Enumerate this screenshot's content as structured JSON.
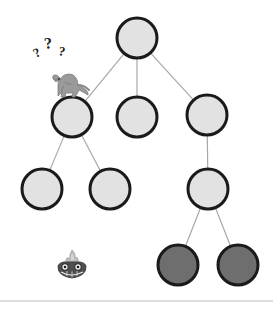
{
  "scene": {
    "title": "search-tree-diagram",
    "width": 273,
    "height": 316,
    "background_color": "#ffffff"
  },
  "palette": {
    "node_light_fill": "#e2e2e2",
    "node_dark_fill": "#6e6e6e",
    "node_stroke": "#1a1a1a",
    "edge_color": "#a8a8a8",
    "baseline_color": "#d0d0d0",
    "thinking_mark_color": "#1a1a1a",
    "dino_body": "#9a9a9a",
    "dino_shade": "#7b7b7b",
    "creature_body": "#4a4a4a",
    "creature_flame": "#b9b9b9"
  },
  "tree": {
    "node_radius": 20,
    "node_stroke_width": 3,
    "edge_stroke_width": 1.2,
    "nodes": [
      {
        "id": "root",
        "label": "node-root",
        "cx": 137,
        "cy": 38,
        "r": 20,
        "state": "light"
      },
      {
        "id": "n-l",
        "label": "node-left-branch",
        "cx": 72,
        "cy": 117,
        "r": 20,
        "state": "light"
      },
      {
        "id": "n-m",
        "label": "node-middle-branch",
        "cx": 137,
        "cy": 117,
        "r": 20,
        "state": "light"
      },
      {
        "id": "n-r",
        "label": "node-right-branch",
        "cx": 207,
        "cy": 115,
        "r": 20,
        "state": "light"
      },
      {
        "id": "n-ll",
        "label": "node-leaf-left",
        "cx": 42,
        "cy": 189,
        "r": 20,
        "state": "light"
      },
      {
        "id": "n-lr",
        "label": "node-leaf-mid-left",
        "cx": 110,
        "cy": 189,
        "r": 20,
        "state": "light"
      },
      {
        "id": "n-rc",
        "label": "node-right-child",
        "cx": 208,
        "cy": 189,
        "r": 20,
        "state": "light"
      },
      {
        "id": "n-rcl",
        "label": "node-goal-left",
        "cx": 178,
        "cy": 265,
        "r": 20,
        "state": "dark"
      },
      {
        "id": "n-rcr",
        "label": "node-goal-right",
        "cx": 238,
        "cy": 265,
        "r": 20,
        "state": "dark"
      }
    ],
    "edges": [
      {
        "from": "root",
        "to": "n-l"
      },
      {
        "from": "root",
        "to": "n-m"
      },
      {
        "from": "root",
        "to": "n-r"
      },
      {
        "from": "n-l",
        "to": "n-ll"
      },
      {
        "from": "n-l",
        "to": "n-lr"
      },
      {
        "from": "n-r",
        "to": "n-rc"
      },
      {
        "from": "n-rc",
        "to": "n-rcl"
      },
      {
        "from": "n-rc",
        "to": "n-rcr"
      }
    ]
  },
  "annotations": {
    "question_marks": {
      "name": "question-marks",
      "text": "? ? ?",
      "marks": [
        {
          "glyph": "?",
          "x": 36,
          "y": 58,
          "size": 13,
          "rotate": -28
        },
        {
          "glyph": "?",
          "x": 45,
          "y": 49,
          "size": 16,
          "rotate": -8
        },
        {
          "glyph": "?",
          "x": 58,
          "y": 55,
          "size": 13,
          "rotate": 10
        }
      ]
    },
    "dinosaur": {
      "name": "dinosaur-figure",
      "x": 48,
      "y": 66,
      "width": 40,
      "height": 32,
      "description": "t-rex standing on node"
    },
    "creature": {
      "name": "flame-creature-figure",
      "x": 56,
      "y": 250,
      "width": 32,
      "height": 30,
      "description": "small creature with flame crest"
    }
  },
  "baseline": {
    "name": "bottom-rule",
    "y": 301,
    "x1": 0,
    "x2": 273
  }
}
